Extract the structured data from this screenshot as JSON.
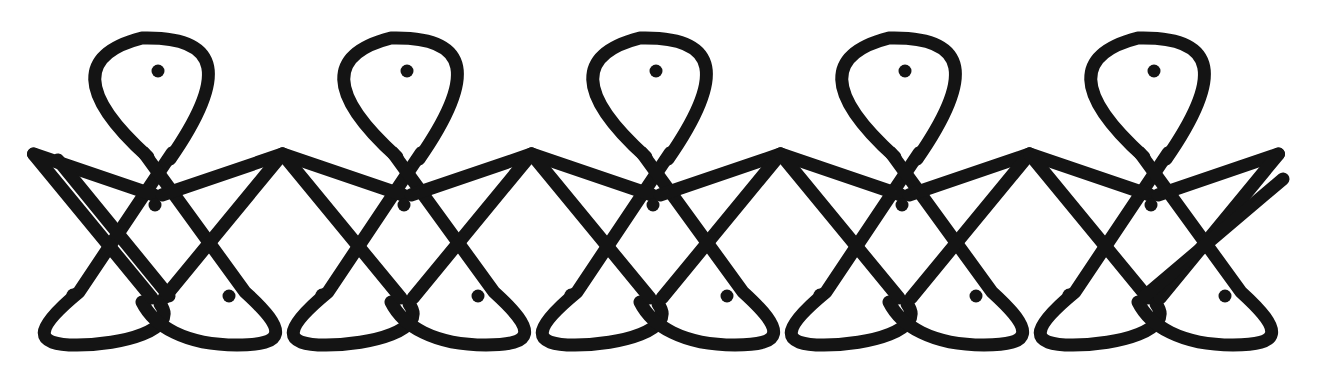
{
  "canvas": {
    "width": 1321,
    "height": 373,
    "background_color": "#ffffff",
    "title": "Sikku Kolam Repeating Border Pattern"
  },
  "artwork": {
    "name": "kolam-pattern",
    "style": "hand-drawn ink line drawing",
    "stroke_color": "#141414",
    "dot_color": "#141414",
    "stroke_width": 13,
    "dot_radius": 6.5,
    "motif_count": 5,
    "motif_period": 249,
    "motif_first_center_x": 158,
    "dots_per_motif": 4,
    "total_dots": 20
  },
  "geometry": {
    "top_loop": {
      "name": "upper-teardrop-loop",
      "apex_y": 38,
      "left_x": 120,
      "right_x": 198,
      "crossing_x": 168,
      "crossing_y": 143
    },
    "center_diamond": {
      "name": "central-diamond",
      "top_y": 143,
      "bottom_y": 300,
      "left_x": 80,
      "right_x": 250
    },
    "bottom_loops": {
      "name": "lower-teardrop-loops",
      "bottom_y": 345,
      "crossing_x": 155,
      "crossing_y": 300,
      "left_extent_x": 37,
      "right_extent_x": 272
    },
    "connector_peak": {
      "name": "inter-motif-peak",
      "apex_x": 290,
      "apex_y": 154
    },
    "left_terminal": {
      "x": 58,
      "y": 160
    },
    "right_terminal": {
      "x": 1283,
      "y": 179
    }
  },
  "dots": {
    "label": "pulli dots",
    "offsets_within_motif": [
      {
        "name": "top-dot",
        "dx": 0,
        "dy": 71
      },
      {
        "name": "center-dot",
        "dx": -3,
        "dy": 205
      },
      {
        "name": "bottom-left-dot",
        "dx": -85,
        "dy": 295
      },
      {
        "name": "bottom-right-dot",
        "dx": 71,
        "dy": 296
      }
    ],
    "positions": [
      {
        "x": 158,
        "y": 71
      },
      {
        "x": 155,
        "y": 205
      },
      {
        "x": 73,
        "y": 295
      },
      {
        "x": 229,
        "y": 296
      },
      {
        "x": 407,
        "y": 71
      },
      {
        "x": 404,
        "y": 205
      },
      {
        "x": 322,
        "y": 295
      },
      {
        "x": 478,
        "y": 296
      },
      {
        "x": 656,
        "y": 71
      },
      {
        "x": 653,
        "y": 205
      },
      {
        "x": 571,
        "y": 295
      },
      {
        "x": 727,
        "y": 296
      },
      {
        "x": 905,
        "y": 71
      },
      {
        "x": 902,
        "y": 205
      },
      {
        "x": 820,
        "y": 295
      },
      {
        "x": 976,
        "y": 296
      },
      {
        "x": 1154,
        "y": 71
      },
      {
        "x": 1151,
        "y": 205
      },
      {
        "x": 1069,
        "y": 295
      },
      {
        "x": 1225,
        "y": 296
      }
    ]
  },
  "paths": {
    "motif_template": "M -100,-140 C -133,-122 -140,-70 -120,-28 C -104,5 -78,28 -10,93 L 76,8 C 96,-12 116,-21 130,-18 M -100,-140 C -67,-158 -30,-150 -10,-120 C 8,-92 7,-55 -10,-28 C -30,4 -62,33 -120,92 L -200,12 C -220,-8 -238,-18 -252,-14",
    "description": "Each motif consists of an upper teardrop loop that crosses itself, descends as two long diagonals into the central diamond, and terminates in two lower teardrop loops that cross each other."
  }
}
